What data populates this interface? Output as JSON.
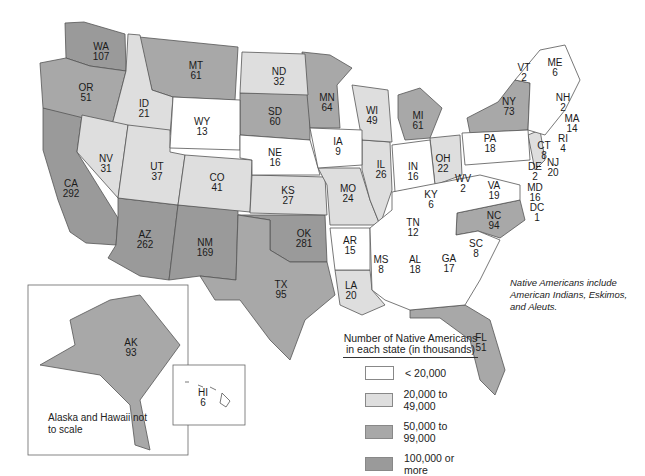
{
  "chart_data": {
    "type": "choropleth",
    "title": "Number of Native Americans in each state (in thousands)",
    "note": "Native Americans include American Indians, Eskimos, and Aleuts.",
    "inset_note": "Alaska and Hawaii not to scale",
    "legend": [
      {
        "label": "< 20,000",
        "color": "#ffffff"
      },
      {
        "label": "20,000 to 49,000",
        "color": "#dedede"
      },
      {
        "label": "50,000 to 99,000",
        "color": "#a8a8a8"
      },
      {
        "label": "100,000 or more",
        "color": "#9a9a9a"
      }
    ],
    "states": [
      {
        "abbr": "WA",
        "value": 107,
        "x": 101,
        "y": 52
      },
      {
        "abbr": "OR",
        "value": 51,
        "x": 86,
        "y": 93
      },
      {
        "abbr": "CA",
        "value": 292,
        "x": 71,
        "y": 189
      },
      {
        "abbr": "ID",
        "value": 21,
        "x": 144,
        "y": 109
      },
      {
        "abbr": "NV",
        "value": 31,
        "x": 106,
        "y": 164
      },
      {
        "abbr": "MT",
        "value": 61,
        "x": 196,
        "y": 71
      },
      {
        "abbr": "WY",
        "value": 13,
        "x": 202,
        "y": 127
      },
      {
        "abbr": "UT",
        "value": 37,
        "x": 157,
        "y": 172
      },
      {
        "abbr": "CO",
        "value": 41,
        "x": 217,
        "y": 183
      },
      {
        "abbr": "AZ",
        "value": 262,
        "x": 145,
        "y": 240
      },
      {
        "abbr": "NM",
        "value": 169,
        "x": 205,
        "y": 248
      },
      {
        "abbr": "ND",
        "value": 32,
        "x": 279,
        "y": 77
      },
      {
        "abbr": "SD",
        "value": 60,
        "x": 275,
        "y": 117
      },
      {
        "abbr": "NE",
        "value": 16,
        "x": 275,
        "y": 158
      },
      {
        "abbr": "KS",
        "value": 27,
        "x": 288,
        "y": 196
      },
      {
        "abbr": "OK",
        "value": 281,
        "x": 304,
        "y": 239
      },
      {
        "abbr": "TX",
        "value": 95,
        "x": 281,
        "y": 290
      },
      {
        "abbr": "MN",
        "value": 64,
        "x": 327,
        "y": 103
      },
      {
        "abbr": "IA",
        "value": 9,
        "x": 338,
        "y": 147
      },
      {
        "abbr": "MO",
        "value": 24,
        "x": 348,
        "y": 194
      },
      {
        "abbr": "AR",
        "value": 15,
        "x": 350,
        "y": 246
      },
      {
        "abbr": "LA",
        "value": 20,
        "x": 351,
        "y": 291
      },
      {
        "abbr": "WI",
        "value": 49,
        "x": 372,
        "y": 116
      },
      {
        "abbr": "IL",
        "value": 26,
        "x": 381,
        "y": 170
      },
      {
        "abbr": "MI",
        "value": 61,
        "x": 418,
        "y": 121
      },
      {
        "abbr": "IN",
        "value": 16,
        "x": 413,
        "y": 172
      },
      {
        "abbr": "OH",
        "value": 22,
        "x": 443,
        "y": 164
      },
      {
        "abbr": "KY",
        "value": 6,
        "x": 431,
        "y": 200
      },
      {
        "abbr": "TN",
        "value": 12,
        "x": 413,
        "y": 228
      },
      {
        "abbr": "MS",
        "value": 8,
        "x": 381,
        "y": 265
      },
      {
        "abbr": "AL",
        "value": 18,
        "x": 415,
        "y": 265
      },
      {
        "abbr": "GA",
        "value": 17,
        "x": 449,
        "y": 264
      },
      {
        "abbr": "FL",
        "value": 51,
        "x": 481,
        "y": 343
      },
      {
        "abbr": "SC",
        "value": 8,
        "x": 476,
        "y": 249
      },
      {
        "abbr": "NC",
        "value": 94,
        "x": 494,
        "y": 221
      },
      {
        "abbr": "VA",
        "value": 19,
        "x": 494,
        "y": 191
      },
      {
        "abbr": "WV",
        "value": 2,
        "x": 463,
        "y": 184
      },
      {
        "abbr": "PA",
        "value": 18,
        "x": 490,
        "y": 144
      },
      {
        "abbr": "NY",
        "value": 73,
        "x": 509,
        "y": 107
      },
      {
        "abbr": "VT",
        "value": 2,
        "x": 524,
        "y": 73
      },
      {
        "abbr": "NH",
        "value": 2,
        "x": 563,
        "y": 103
      },
      {
        "abbr": "ME",
        "value": 6,
        "x": 555,
        "y": 68
      },
      {
        "abbr": "MA",
        "value": 14,
        "x": 572,
        "y": 124
      },
      {
        "abbr": "RI",
        "value": 4,
        "x": 563,
        "y": 144
      },
      {
        "abbr": "CT",
        "value": 8,
        "x": 544,
        "y": 151
      },
      {
        "abbr": "NJ",
        "value": 20,
        "x": 553,
        "y": 168
      },
      {
        "abbr": "DE",
        "value": 2,
        "x": 535,
        "y": 172
      },
      {
        "abbr": "MD",
        "value": 16,
        "x": 535,
        "y": 193
      },
      {
        "abbr": "DC",
        "value": 1,
        "x": 537,
        "y": 213
      },
      {
        "abbr": "AK",
        "value": 93,
        "x": 131,
        "y": 348
      },
      {
        "abbr": "HI",
        "value": 6,
        "x": 203,
        "y": 398
      }
    ]
  }
}
